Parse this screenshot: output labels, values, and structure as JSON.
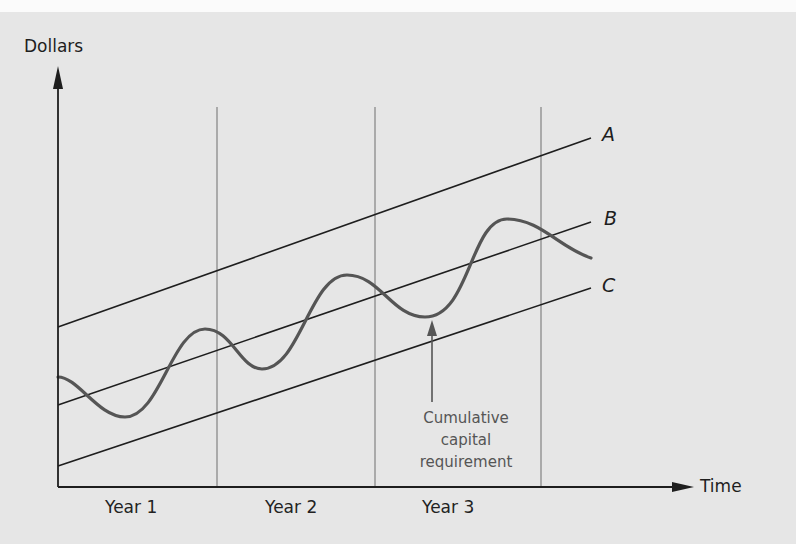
{
  "diagram": {
    "y_axis": {
      "label": "Dollars"
    },
    "x_axis": {
      "label": "Time"
    },
    "periods": [
      "Year 1",
      "Year 2",
      "Year 3"
    ],
    "lines": [
      {
        "id": "A",
        "label": "A",
        "description": "Upper straight financing line"
      },
      {
        "id": "B",
        "label": "B",
        "description": "Middle straight financing line"
      },
      {
        "id": "C",
        "label": "C",
        "description": "Lower straight financing line"
      }
    ],
    "curve": {
      "label": "Cumulative capital requirement",
      "shape": "rising sinusoidal wave"
    },
    "annotation": {
      "lines": [
        "Cumulative",
        "capital",
        "requirement"
      ]
    },
    "colors": {
      "background": "#e6e6e6",
      "axis": "#1e1e1e",
      "grid": "#8a8a8a",
      "straight_lines": "#1e1e1e",
      "curve": "#555555",
      "annotation": "#555555"
    }
  }
}
